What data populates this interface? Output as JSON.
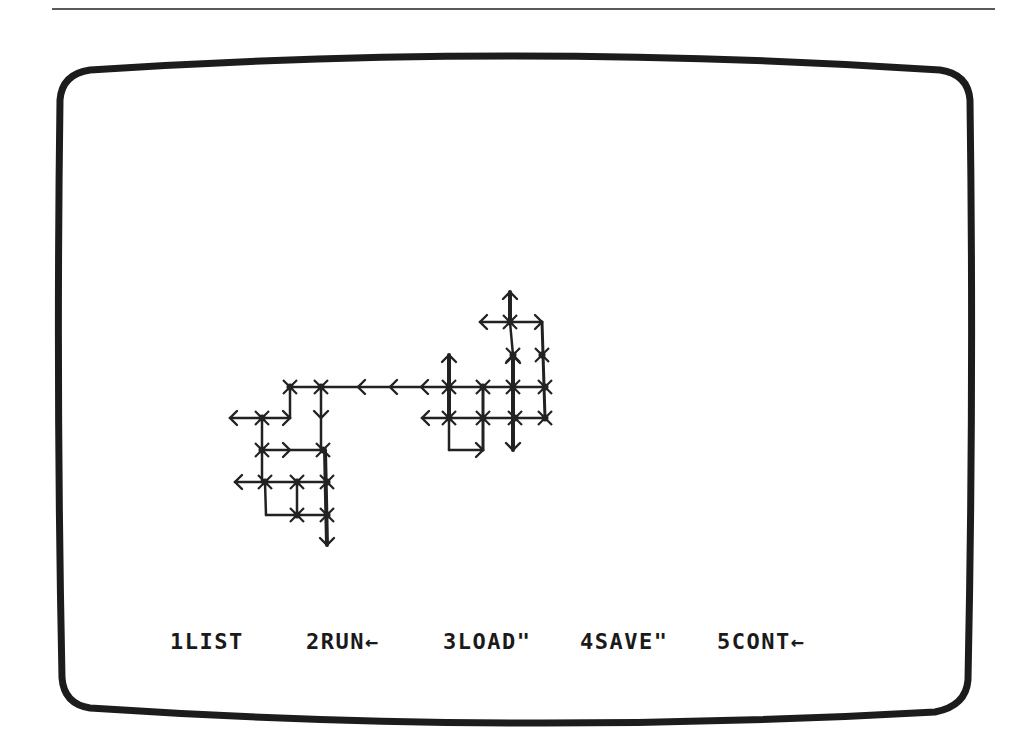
{
  "screen": {
    "bezel_color": "#1c1c1c",
    "ink_color": "#222222",
    "background": "#ffffff"
  },
  "function_keys": [
    {
      "number": "1",
      "label": "LIST",
      "suffix": "",
      "text": "1LIST",
      "x": 170
    },
    {
      "number": "2",
      "label": "RUN",
      "suffix": "←",
      "text": "2RUN←",
      "x": 306
    },
    {
      "number": "3",
      "label": "LOAD",
      "suffix": "\"",
      "text": "3LOAD\"",
      "x": 443
    },
    {
      "number": "4",
      "label": "SAVE",
      "suffix": "\"",
      "text": "4SAVE\"",
      "x": 580
    },
    {
      "number": "5",
      "label": "CONT",
      "suffix": "←",
      "text": "5CONT←",
      "x": 717
    }
  ],
  "graph": {
    "segments": [
      {
        "x1": 290,
        "y1": 387,
        "x2": 449,
        "y2": 387,
        "w": 2.5
      },
      {
        "x1": 449,
        "y1": 387,
        "x2": 545,
        "y2": 387,
        "w": 2.5
      },
      {
        "x1": 290,
        "y1": 387,
        "x2": 290,
        "y2": 418,
        "w": 2.5
      },
      {
        "x1": 321,
        "y1": 387,
        "x2": 321,
        "y2": 450,
        "w": 2.5
      },
      {
        "x1": 230,
        "y1": 418,
        "x2": 290,
        "y2": 418,
        "w": 2.5
      },
      {
        "x1": 262,
        "y1": 418,
        "x2": 262,
        "y2": 482,
        "w": 2.5
      },
      {
        "x1": 262,
        "y1": 450,
        "x2": 323,
        "y2": 450,
        "w": 2.5
      },
      {
        "x1": 235,
        "y1": 482,
        "x2": 327,
        "y2": 482,
        "w": 2.5
      },
      {
        "x1": 265,
        "y1": 482,
        "x2": 266,
        "y2": 515,
        "w": 2.5
      },
      {
        "x1": 297,
        "y1": 482,
        "x2": 297,
        "y2": 515,
        "w": 2.5
      },
      {
        "x1": 266,
        "y1": 515,
        "x2": 327,
        "y2": 515,
        "w": 2.5
      },
      {
        "x1": 325,
        "y1": 450,
        "x2": 327,
        "y2": 545,
        "w": 4
      },
      {
        "x1": 449,
        "y1": 355,
        "x2": 449,
        "y2": 418,
        "w": 4
      },
      {
        "x1": 422,
        "y1": 418,
        "x2": 545,
        "y2": 418,
        "w": 2.5
      },
      {
        "x1": 449,
        "y1": 418,
        "x2": 449,
        "y2": 450,
        "w": 2.5
      },
      {
        "x1": 449,
        "y1": 450,
        "x2": 483,
        "y2": 450,
        "w": 2.5
      },
      {
        "x1": 483,
        "y1": 387,
        "x2": 483,
        "y2": 450,
        "w": 3
      },
      {
        "x1": 513,
        "y1": 355,
        "x2": 513,
        "y2": 450,
        "w": 4
      },
      {
        "x1": 510,
        "y1": 292,
        "x2": 510,
        "y2": 322,
        "w": 4
      },
      {
        "x1": 510,
        "y1": 322,
        "x2": 513,
        "y2": 355,
        "w": 2.5
      },
      {
        "x1": 480,
        "y1": 322,
        "x2": 542,
        "y2": 322,
        "w": 2.5
      },
      {
        "x1": 542,
        "y1": 322,
        "x2": 545,
        "y2": 418,
        "w": 3
      }
    ],
    "nodes": [
      {
        "x": 290,
        "y": 387
      },
      {
        "x": 321,
        "y": 387
      },
      {
        "x": 262,
        "y": 418
      },
      {
        "x": 323,
        "y": 450
      },
      {
        "x": 262,
        "y": 450
      },
      {
        "x": 265,
        "y": 482
      },
      {
        "x": 297,
        "y": 482
      },
      {
        "x": 327,
        "y": 482
      },
      {
        "x": 297,
        "y": 515
      },
      {
        "x": 327,
        "y": 515
      },
      {
        "x": 449,
        "y": 387
      },
      {
        "x": 483,
        "y": 387
      },
      {
        "x": 513,
        "y": 387
      },
      {
        "x": 545,
        "y": 387
      },
      {
        "x": 449,
        "y": 418
      },
      {
        "x": 483,
        "y": 418
      },
      {
        "x": 515,
        "y": 418
      },
      {
        "x": 545,
        "y": 418
      },
      {
        "x": 510,
        "y": 322
      },
      {
        "x": 542,
        "y": 355
      },
      {
        "x": 513,
        "y": 355
      }
    ],
    "arrows": [
      {
        "x": 230,
        "y": 418,
        "dir": "left"
      },
      {
        "x": 235,
        "y": 482,
        "dir": "left"
      },
      {
        "x": 422,
        "y": 418,
        "dir": "left"
      },
      {
        "x": 480,
        "y": 322,
        "dir": "left"
      },
      {
        "x": 358,
        "y": 387,
        "dir": "left"
      },
      {
        "x": 390,
        "y": 387,
        "dir": "left"
      },
      {
        "x": 421,
        "y": 387,
        "dir": "left"
      },
      {
        "x": 290,
        "y": 418,
        "dir": "right"
      },
      {
        "x": 290,
        "y": 450,
        "dir": "right"
      },
      {
        "x": 542,
        "y": 322,
        "dir": "right"
      },
      {
        "x": 483,
        "y": 450,
        "dir": "right"
      },
      {
        "x": 321,
        "y": 418,
        "dir": "down"
      },
      {
        "x": 327,
        "y": 545,
        "dir": "down"
      },
      {
        "x": 513,
        "y": 450,
        "dir": "down"
      },
      {
        "x": 510,
        "y": 292,
        "dir": "up"
      },
      {
        "x": 449,
        "y": 355,
        "dir": "up"
      },
      {
        "x": 513,
        "y": 356,
        "dir": "up"
      }
    ]
  }
}
